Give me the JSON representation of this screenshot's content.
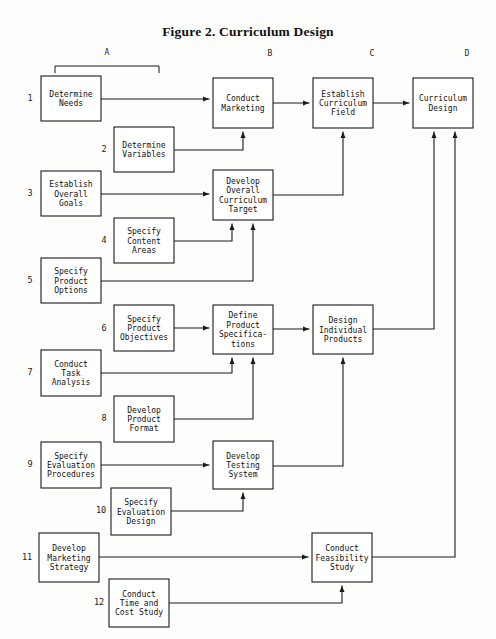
{
  "figure": {
    "title": "Figure 2. Curriculum Design",
    "width": 496,
    "height": 639
  },
  "column_headers": [
    {
      "label": "A",
      "x": 107,
      "y": 55
    },
    {
      "label": "B",
      "x": 270,
      "y": 56
    },
    {
      "label": "C",
      "x": 372,
      "y": 56
    },
    {
      "label": "D",
      "x": 467,
      "y": 56
    }
  ],
  "bracket": {
    "x1": 55,
    "x2": 159,
    "y": 66,
    "tick": 7
  },
  "row_numbers": [
    {
      "label": "1",
      "x": 30,
      "y": 101
    },
    {
      "label": "2",
      "x": 104,
      "y": 152
    },
    {
      "label": "3",
      "x": 30,
      "y": 196
    },
    {
      "label": "4",
      "x": 104,
      "y": 243
    },
    {
      "label": "5",
      "x": 30,
      "y": 283
    },
    {
      "label": "6",
      "x": 104,
      "y": 331
    },
    {
      "label": "7",
      "x": 30,
      "y": 375
    },
    {
      "label": "8",
      "x": 104,
      "y": 421
    },
    {
      "label": "9",
      "x": 30,
      "y": 467
    },
    {
      "label": "10",
      "x": 101,
      "y": 513
    },
    {
      "label": "11",
      "x": 27,
      "y": 560
    },
    {
      "label": "12",
      "x": 99,
      "y": 605
    }
  ],
  "boxes": [
    {
      "id": "determine-needs",
      "lines": [
        "Determine",
        "Needs"
      ],
      "x": 41,
      "y": 76,
      "w": 60,
      "h": 45
    },
    {
      "id": "determine-variables",
      "lines": [
        "Determine",
        "Variables"
      ],
      "x": 114,
      "y": 127,
      "w": 60,
      "h": 45
    },
    {
      "id": "conduct-marketing",
      "lines": [
        "Conduct",
        "Marketing"
      ],
      "x": 213,
      "y": 78,
      "w": 60,
      "h": 50
    },
    {
      "id": "establish-curriculum-field",
      "lines": [
        "Establish",
        "Curriculum",
        "Field"
      ],
      "x": 313,
      "y": 78,
      "w": 60,
      "h": 50
    },
    {
      "id": "curriculum-design",
      "lines": [
        "Curriculum",
        "Design"
      ],
      "x": 413,
      "y": 78,
      "w": 60,
      "h": 50
    },
    {
      "id": "establish-overall-goals",
      "lines": [
        "Establish",
        "Overall",
        "Goals"
      ],
      "x": 41,
      "y": 171,
      "w": 60,
      "h": 45
    },
    {
      "id": "develop-overall-target",
      "lines": [
        "Develop",
        "Overall",
        "Curriculum",
        "Target"
      ],
      "x": 213,
      "y": 170,
      "w": 60,
      "h": 50
    },
    {
      "id": "specify-content-areas",
      "lines": [
        "Specify",
        "Content",
        "Areas"
      ],
      "x": 114,
      "y": 218,
      "w": 60,
      "h": 45
    },
    {
      "id": "specify-product-options",
      "lines": [
        "Specify",
        "Product",
        "Options"
      ],
      "x": 41,
      "y": 258,
      "w": 60,
      "h": 45
    },
    {
      "id": "specify-product-objectives",
      "lines": [
        "Specify",
        "Product",
        "Objectives"
      ],
      "x": 114,
      "y": 305,
      "w": 60,
      "h": 46
    },
    {
      "id": "define-product-specs",
      "lines": [
        "Define",
        "Product",
        "Specifica-",
        "tions"
      ],
      "x": 213,
      "y": 305,
      "w": 60,
      "h": 49
    },
    {
      "id": "design-individual-products",
      "lines": [
        "Design",
        "Individual",
        "Products"
      ],
      "x": 313,
      "y": 305,
      "w": 60,
      "h": 49
    },
    {
      "id": "conduct-task-analysis",
      "lines": [
        "Conduct",
        "Task",
        "Analysis"
      ],
      "x": 41,
      "y": 350,
      "w": 60,
      "h": 46
    },
    {
      "id": "develop-product-format",
      "lines": [
        "Develop",
        "Product",
        "Format"
      ],
      "x": 114,
      "y": 396,
      "w": 60,
      "h": 46
    },
    {
      "id": "specify-evaluation-procs",
      "lines": [
        "Specify",
        "Evaluation",
        "Procedures"
      ],
      "x": 41,
      "y": 442,
      "w": 60,
      "h": 46
    },
    {
      "id": "develop-testing-system",
      "lines": [
        "Develop",
        "Testing",
        "System"
      ],
      "x": 213,
      "y": 441,
      "w": 60,
      "h": 48
    },
    {
      "id": "specify-evaluation-design",
      "lines": [
        "Specify",
        "Evaluation",
        "Design"
      ],
      "x": 111,
      "y": 488,
      "w": 60,
      "h": 47
    },
    {
      "id": "develop-marketing-strategy",
      "lines": [
        "Develop",
        "Marketing",
        "Strategy"
      ],
      "x": 39,
      "y": 533,
      "w": 60,
      "h": 49
    },
    {
      "id": "conduct-feasibility-study",
      "lines": [
        "Conduct",
        "Feasibility",
        "Study"
      ],
      "x": 312,
      "y": 533,
      "w": 60,
      "h": 49
    },
    {
      "id": "conduct-time-cost-study",
      "lines": [
        "Conduct",
        "Time and",
        "Cost Study"
      ],
      "x": 109,
      "y": 579,
      "w": 60,
      "h": 48
    }
  ],
  "connections": [
    {
      "id": "needs-to-marketing",
      "points": "101,99 209,99",
      "arrow": "right"
    },
    {
      "id": "variables-to-marketing",
      "points": "174,150 243,150 243,132",
      "arrow": "up"
    },
    {
      "id": "marketing-to-field",
      "points": "273,103 309,103",
      "arrow": "right"
    },
    {
      "id": "field-to-design",
      "points": "373,103 409,103",
      "arrow": "right"
    },
    {
      "id": "goals-to-target",
      "points": "101,194 209,194",
      "arrow": "right"
    },
    {
      "id": "target-to-field",
      "points": "273,195 343,195 343,132",
      "arrow": "up"
    },
    {
      "id": "content-to-target",
      "points": "174,241 232,241 232,224",
      "arrow": "up"
    },
    {
      "id": "options-to-target",
      "points": "101,281 253,281 253,224",
      "arrow": "up"
    },
    {
      "id": "objectives-to-specs",
      "points": "174,328 209,328",
      "arrow": "right"
    },
    {
      "id": "specs-to-products",
      "points": "273,329 309,329",
      "arrow": "right"
    },
    {
      "id": "products-to-curriculum-design",
      "points": "373,329 434,329 434,132",
      "arrow": "up"
    },
    {
      "id": "task-analysis-to-specs",
      "points": "101,373 232,373 232,358",
      "arrow": "up"
    },
    {
      "id": "product-format-to-specs",
      "points": "174,419 253,419 253,358",
      "arrow": "up"
    },
    {
      "id": "eval-procs-to-testing",
      "points": "101,465 209,465",
      "arrow": "right"
    },
    {
      "id": "testing-to-products",
      "points": "273,466 343,466 343,358",
      "arrow": "up"
    },
    {
      "id": "eval-design-to-testing",
      "points": "171,511 243,511 243,493",
      "arrow": "up"
    },
    {
      "id": "marketing-strategy-to-feas",
      "points": "99,557 308,557",
      "arrow": "right"
    },
    {
      "id": "feasibility-to-curriculum",
      "points": "372,557 455,557 455,132",
      "arrow": "up"
    },
    {
      "id": "time-cost-to-feasibility",
      "points": "169,603 342,603 342,586",
      "arrow": "up"
    }
  ]
}
